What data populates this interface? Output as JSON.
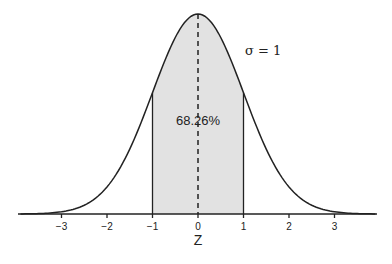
{
  "chart_data": {
    "type": "area",
    "title": "",
    "xlabel": "Z",
    "ylabel": "",
    "xlim": [
      -3.9,
      3.9
    ],
    "x_ticks": [
      -3,
      -2,
      -1,
      0,
      1,
      2,
      3
    ],
    "x_tick_labels": [
      "−3",
      "−2",
      "−1",
      "0",
      "1",
      "2",
      "3"
    ],
    "mean": 0,
    "sigma": 1,
    "shaded_region": {
      "from": -1,
      "to": 1,
      "label": "68.26%"
    },
    "annotations": [
      {
        "text": "σ = 1",
        "x": 1.3,
        "position": "right of curve near top"
      },
      {
        "text": "68.26%",
        "x": 0,
        "position": "center of shaded region"
      }
    ],
    "mean_line": {
      "x": 0,
      "style": "dashed"
    },
    "grid": false,
    "legend": null
  },
  "labels": {
    "axis_title": "Z",
    "sigma_label": "σ = 1",
    "percent_label": "68.26%"
  }
}
